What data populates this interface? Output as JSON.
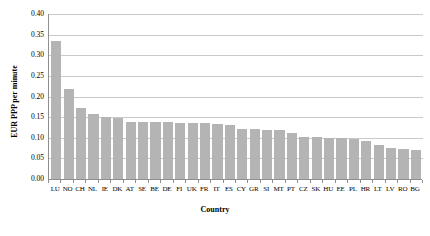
{
  "chart_data": {
    "type": "bar",
    "title": "",
    "xlabel": "Country",
    "ylabel": "EUR PPP per minute",
    "ylim": [
      0,
      0.4
    ],
    "ytick_labels": [
      "0.00",
      "0.05",
      "0.10",
      "0.15",
      "0.20",
      "0.25",
      "0.30",
      "0.35",
      "0.40"
    ],
    "ytick_values": [
      0,
      0.05,
      0.1,
      0.15,
      0.2,
      0.25,
      0.3,
      0.35,
      0.4
    ],
    "grid": true,
    "legend": "none",
    "bar_color": "#b4b4b4",
    "gridline_color": "#c9c9c9",
    "axis_color": "#8f8f8f",
    "categories": [
      "LU",
      "NO",
      "CH",
      "NL",
      "IE",
      "DK",
      "AT",
      "SE",
      "BE",
      "DE",
      "FI",
      "UK",
      "FR",
      "IT",
      "ES",
      "CY",
      "GR",
      "SI",
      "MT",
      "PT",
      "CZ",
      "SK",
      "HU",
      "EE",
      "PL",
      "HR",
      "LT",
      "LV",
      "RO",
      "BG"
    ],
    "values": [
      0.335,
      0.218,
      0.172,
      0.157,
      0.151,
      0.149,
      0.139,
      0.139,
      0.138,
      0.138,
      0.137,
      0.136,
      0.135,
      0.134,
      0.13,
      0.122,
      0.121,
      0.12,
      0.118,
      0.112,
      0.102,
      0.101,
      0.1,
      0.099,
      0.098,
      0.092,
      0.082,
      0.074,
      0.072,
      0.071
    ]
  }
}
